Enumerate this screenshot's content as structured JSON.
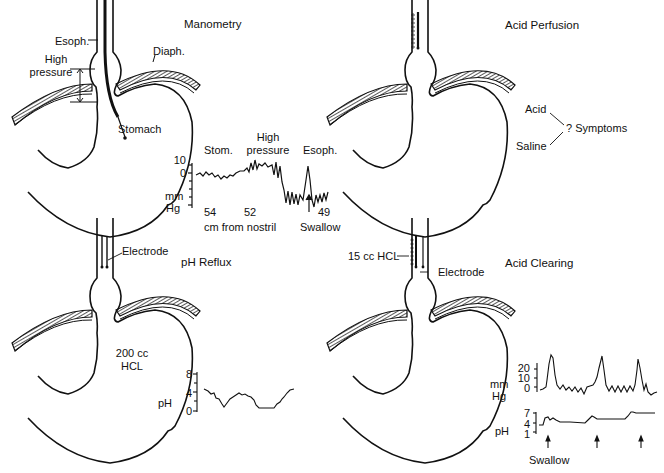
{
  "panels": {
    "manometry": {
      "title": "Manometry",
      "labels": {
        "esoph": "Esoph.",
        "diaph": "Diaph.",
        "high_pressure_line1": "High",
        "high_pressure_line2": "pressure",
        "stomach": "Stomach"
      },
      "trace": {
        "segment_labels": [
          "Stom.",
          "High",
          "pressure",
          "Esoph."
        ],
        "y_ticks": [
          "10",
          "0"
        ],
        "y_unit_line1": "mm",
        "y_unit_line2": "Hg",
        "x_values": [
          "54",
          "52",
          "49"
        ],
        "x_label": "cm from nostril",
        "annotation": "Swallow"
      }
    },
    "acid_perfusion": {
      "title": "Acid Perfusion",
      "labels": {
        "acid": "Acid",
        "saline": "Saline",
        "symptoms": "? Symptoms"
      }
    },
    "ph_reflux": {
      "title": "pH Reflux",
      "labels": {
        "electrode": "Electrode",
        "volume_line1": "200 cc",
        "volume_line2": "HCL",
        "ph": "pH"
      },
      "trace": {
        "y_ticks": [
          "8",
          "4",
          "0"
        ]
      }
    },
    "acid_clearing": {
      "title": "Acid Clearing",
      "labels": {
        "hcl": "15 cc HCL",
        "electrode": "Electrode"
      },
      "pressure_trace": {
        "y_ticks": [
          "20",
          "10",
          "0"
        ],
        "y_unit_line1": "mm",
        "y_unit_line2": "Hg"
      },
      "ph_trace": {
        "y_ticks": [
          "7",
          "4",
          "1"
        ],
        "y_unit": "pH"
      },
      "annotation": "Swallow"
    }
  },
  "colors": {
    "ink": "#111111",
    "background": "#ffffff"
  }
}
